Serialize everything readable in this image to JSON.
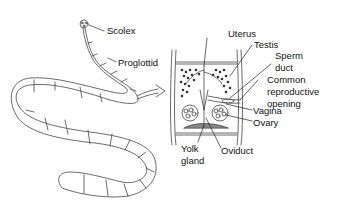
{
  "diagram": {
    "labels": {
      "scolex": "Scolex",
      "proglottid": "Proglottid",
      "uterus": "Uterus",
      "testis": "Testis",
      "sperm_duct_1": "Sperm",
      "sperm_duct_2": "duct",
      "common_1": "Common",
      "common_2": "reproductive",
      "common_3": "opening",
      "vagina": "Vagina",
      "ovary": "Ovary",
      "yolk_1": "Yolk",
      "yolk_2": "gland",
      "oviduct": "Oviduct"
    },
    "colors": {
      "line": "#333333",
      "background": "#ffffff"
    }
  }
}
